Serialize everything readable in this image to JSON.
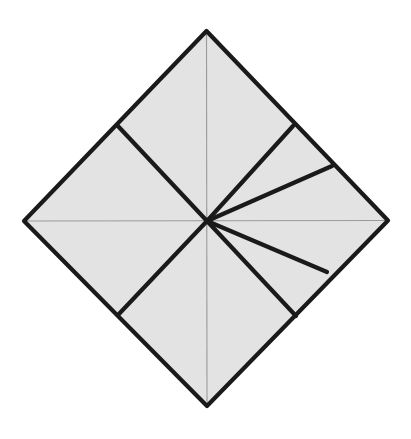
{
  "figure": {
    "type": "geometric-diagram",
    "canvas": {
      "width": 411,
      "height": 439,
      "background": "#ffffff"
    },
    "colors": {
      "fill": "#e3e3e3",
      "outline": "#1a1a1a",
      "spoke": "#1a1a1a",
      "axis": "#9a9a9a"
    },
    "strokes": {
      "outline_width": 4.2,
      "spoke_width": 4.2,
      "axis_width": 1.1
    },
    "points": {
      "center": {
        "name": "center",
        "x": 207,
        "y": 221
      },
      "top": {
        "name": "top-vertex",
        "x": 206.5,
        "y": 31
      },
      "right": {
        "name": "right-vertex",
        "x": 388,
        "y": 220.5
      },
      "bottom": {
        "name": "bottom-vertex",
        "x": 207,
        "y": 406
      },
      "left": {
        "name": "left-vertex",
        "x": 24,
        "y": 221
      },
      "nw_edge": {
        "name": "nw-edge-node",
        "x": 117,
        "y": 125
      },
      "ne_edge_upper": {
        "name": "ne-edge-upper-node",
        "x": 293,
        "y": 126
      },
      "ne_edge_lower": {
        "name": "ne-edge-lower-node",
        "x": 332,
        "y": 166
      },
      "se_edge_upper": {
        "name": "se-edge-upper-node",
        "x": 327,
        "y": 272
      },
      "se_edge_lower": {
        "name": "se-edge-lower-node",
        "x": 296,
        "y": 316
      },
      "sw_edge": {
        "name": "sw-edge-node",
        "x": 118,
        "y": 315
      }
    },
    "outline_path": "M 206.5 31 L 388 220.5 L 207 406 L 24 221 Z",
    "fill_path": "M 206.5 31 L 388 220.5 L 207 406 L 24 221 Z",
    "axes": [
      {
        "name": "horizontal-axis",
        "x1": 24,
        "y1": 221,
        "x2": 388,
        "y2": 220.5
      },
      {
        "name": "vertical-axis",
        "x1": 206.5,
        "y1": 31,
        "x2": 207,
        "y2": 406
      }
    ],
    "spokes": [
      {
        "name": "spoke-nw",
        "x1": 207,
        "y1": 221,
        "x2": 117,
        "y2": 125
      },
      {
        "name": "spoke-ne-upper",
        "x1": 207,
        "y1": 221,
        "x2": 293,
        "y2": 126
      },
      {
        "name": "spoke-ne-lower",
        "x1": 207,
        "y1": 221,
        "x2": 332,
        "y2": 166
      },
      {
        "name": "spoke-se-upper",
        "x1": 207,
        "y1": 221,
        "x2": 327,
        "y2": 272
      },
      {
        "name": "spoke-se-lower",
        "x1": 207,
        "y1": 221,
        "x2": 296,
        "y2": 316
      },
      {
        "name": "spoke-sw",
        "x1": 207,
        "y1": 221,
        "x2": 118,
        "y2": 315
      }
    ],
    "region_count": 8,
    "spoke_count": 6
  }
}
